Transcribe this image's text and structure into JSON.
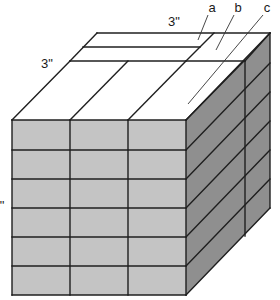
{
  "diagram": {
    "colors": {
      "background": "#ffffff",
      "top_face": "#ffffff",
      "front_face": "#c4c4c4",
      "right_face": "#8f8f8f",
      "line": "#1f1f1f",
      "leader": "#333333"
    },
    "labels": [
      {
        "id": "label-a",
        "text": "a",
        "x": 212,
        "y": 12,
        "size": 13
      },
      {
        "id": "label-b",
        "text": "b",
        "x": 238,
        "y": 12,
        "size": 13
      },
      {
        "id": "label-c",
        "text": "c",
        "x": 267,
        "y": 12,
        "size": 13
      },
      {
        "id": "dim-top",
        "text": "3\"",
        "x": 174,
        "y": 26,
        "size": 13
      },
      {
        "id": "dim-left",
        "text": "3\"",
        "x": 47,
        "y": 68,
        "size": 13
      },
      {
        "id": "dim-side",
        "text": "\"",
        "x": 2,
        "y": 210,
        "size": 13
      }
    ],
    "leaders": [
      {
        "id": "leader-a",
        "x1": 208,
        "y1": 15,
        "x2": 198,
        "y2": 40
      },
      {
        "id": "leader-b",
        "x1": 234,
        "y1": 15,
        "x2": 216,
        "y2": 50
      },
      {
        "id": "leader-c",
        "x1": 263,
        "y1": 15,
        "x2": 188,
        "y2": 104
      }
    ],
    "front_face": {
      "x0": 12,
      "x1": 186,
      "y0": 120,
      "y1": 295,
      "columns": [
        12,
        70,
        128,
        186
      ],
      "rows": [
        120,
        150,
        179,
        208,
        237,
        266,
        295
      ]
    },
    "depth_offset": {
      "dx": 84,
      "dy": -87
    },
    "top_face": {
      "back_left": [
        97,
        33
      ],
      "back_right": [
        270,
        33
      ],
      "strip_front_y": 61,
      "strip_front_x0": 70,
      "strip_front_x1": 245,
      "strip_mid": {
        "x0": 83,
        "y": 47,
        "x1": 200
      },
      "strip_end": {
        "top": [
          214,
          33
        ],
        "bottom": [
          186,
          61
        ]
      }
    },
    "right_face": {
      "inner_vertical_x": 245,
      "inner_vertical_y0": 61,
      "inner_vertical_y1": 236,
      "back_edge_x": 270,
      "back_edge_y0": 33,
      "back_edge_y1": 208
    },
    "caption": {
      "summary": "Cube built from 3\" x 3\" blocks: stacked rows of gray blocks; top layer shows strips a, b and blocks c."
    }
  }
}
